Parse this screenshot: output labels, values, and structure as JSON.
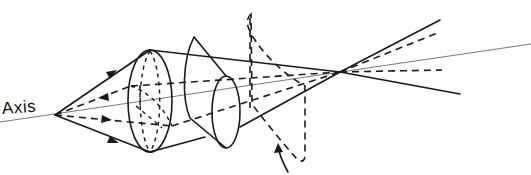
{
  "diagram": {
    "labels": {
      "axis": "Axis"
    },
    "colors": {
      "line": "#1a1a1a",
      "axis_line": "#555555",
      "background": "#ffffff"
    },
    "points": {
      "object_point": [
        55,
        115
      ],
      "image_point": [
        340,
        72
      ]
    },
    "axis_line": {
      "from": [
        0,
        122
      ],
      "to": [
        531,
        44
      ]
    },
    "elements": [
      {
        "id": "lens-1",
        "type": "ellipse-lens",
        "cx": 150,
        "cy": 101,
        "rx": 22,
        "ry": 51
      },
      {
        "id": "lens-2",
        "type": "conical-lens",
        "apex": [
          194,
          37
        ],
        "cx": 226,
        "cy": 112,
        "rx": 14,
        "ry": 36
      },
      {
        "id": "image-plane-ring",
        "type": "dashed-tilted-ellipse",
        "x1": 250,
        "x2": 306,
        "y_top": 12,
        "y_bottom": 160
      }
    ],
    "rays": [
      {
        "id": "upper-marginal",
        "style": "solid",
        "arrow": "forward"
      },
      {
        "id": "upper-sagittal",
        "style": "dashed",
        "arrow": "backward"
      },
      {
        "id": "lower-sagittal",
        "style": "dashed",
        "arrow": "forward"
      },
      {
        "id": "lower-marginal",
        "style": "solid",
        "arrow": "forward"
      }
    ],
    "annotation_arrow": {
      "tip": [
        278,
        148
      ],
      "tail": [
        288,
        172
      ],
      "points_to": "image-plane-ring"
    }
  }
}
